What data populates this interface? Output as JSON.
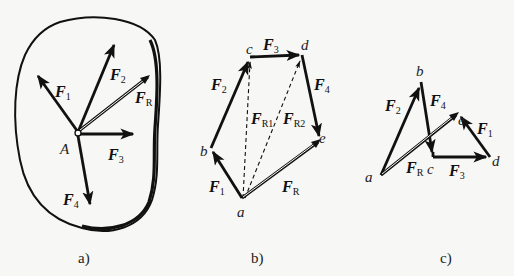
{
  "panels": [
    {
      "id": "a",
      "caption": "a)",
      "point_label": "A",
      "forces": [
        {
          "name": "F",
          "sub": "1"
        },
        {
          "name": "F",
          "sub": "2"
        },
        {
          "name": "F",
          "sub": "R"
        },
        {
          "name": "F",
          "sub": "3"
        },
        {
          "name": "F",
          "sub": "4"
        }
      ]
    },
    {
      "id": "b",
      "caption": "b)",
      "points": [
        "a",
        "b",
        "c",
        "d",
        "e"
      ],
      "forces": [
        {
          "name": "F",
          "sub": "1"
        },
        {
          "name": "F",
          "sub": "2"
        },
        {
          "name": "F",
          "sub": "3"
        },
        {
          "name": "F",
          "sub": "4"
        },
        {
          "name": "F",
          "sub": "R1"
        },
        {
          "name": "F",
          "sub": "R2"
        },
        {
          "name": "F",
          "sub": "R"
        }
      ]
    },
    {
      "id": "c",
      "caption": "c)",
      "points": [
        "a",
        "b",
        "c",
        "d",
        "e"
      ],
      "forces": [
        {
          "name": "F",
          "sub": "2"
        },
        {
          "name": "F",
          "sub": "4"
        },
        {
          "name": "F",
          "sub": "1"
        },
        {
          "name": "F",
          "sub": "R"
        },
        {
          "name": "F",
          "sub": "3"
        }
      ]
    }
  ],
  "colors": {
    "ink": "#111111",
    "background": "#f7f7f5"
  }
}
